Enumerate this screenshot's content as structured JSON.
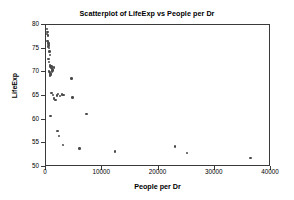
{
  "chart_data": {
    "type": "scatter",
    "title": "Scatterplot of LifeExp vs People per Dr",
    "xlabel": "People per Dr",
    "ylabel": "LifeExp",
    "xlim": [
      0,
      40000
    ],
    "ylim": [
      50,
      80
    ],
    "xticks": [
      0,
      10000,
      20000,
      30000,
      40000
    ],
    "xtick_labels": [
      "0",
      "10000",
      "20000",
      "30000",
      "40000"
    ],
    "yticks": [
      50,
      55,
      60,
      65,
      70,
      75,
      80
    ],
    "ytick_labels": [
      "50",
      "55",
      "60",
      "65",
      "70",
      "75",
      "80"
    ],
    "grid": false,
    "legend": false,
    "marker": "circle",
    "marker_color": "#4a4a4a",
    "frame_color": "#3a3a3a",
    "series": [
      {
        "name": "Countries",
        "x": [
          370,
          430,
          340,
          520,
          470,
          560,
          610,
          650,
          700,
          620,
          540,
          760,
          820,
          900,
          640,
          700,
          880,
          950,
          1030,
          1180,
          1250,
          1350,
          760,
          820,
          900,
          980,
          1100,
          1220,
          1400,
          1560,
          900,
          1150,
          1380,
          1600,
          1850,
          2100,
          2350,
          2700,
          3050,
          3300,
          4700,
          4900,
          7400,
          1000,
          2200,
          2500,
          3150,
          6100,
          12400,
          23100,
          25200,
          36500
        ],
        "y": [
          78.9,
          78.3,
          77.9,
          77.6,
          76.4,
          76.2,
          76.0,
          75.8,
          75.6,
          75.3,
          75.1,
          74.9,
          74.2,
          73.5,
          72.6,
          72.0,
          71.4,
          71.0,
          70.8,
          71.0,
          70.6,
          70.2,
          70.1,
          69.9,
          69.7,
          69.5,
          69.3,
          69.9,
          70.3,
          70.8,
          69.1,
          65.4,
          65.0,
          64.3,
          64.0,
          64.9,
          65.2,
          64.8,
          65.1,
          65.0,
          68.5,
          64.5,
          61.0,
          60.6,
          57.4,
          56.4,
          54.5,
          53.7,
          53.1,
          54.1,
          52.7,
          51.7
        ]
      }
    ]
  }
}
